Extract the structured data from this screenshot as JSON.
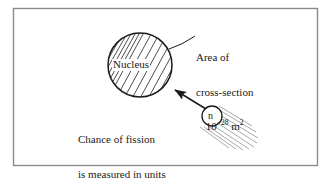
{
  "figure": {
    "border_color": "#8a8a8a",
    "ink_color": "#1a1a1a",
    "hatch_color": "#3a3a3a",
    "trail_color": "#9a9a9a",
    "background": "#ffffff"
  },
  "nucleus": {
    "label": "Nucleus",
    "shape": "hatched-circle",
    "center_x": 140,
    "center_y": 65,
    "radius": 32
  },
  "neutron": {
    "label": "n",
    "shape": "small-circle",
    "center_x": 212,
    "center_y": 116,
    "radius": 10,
    "trail_lines": 9
  },
  "annotation": {
    "line1": "Area of",
    "line2": "cross-section",
    "value_base": "10",
    "value_exponent": "−28",
    "value_unit": "m",
    "unit_exponent": "2"
  },
  "note": {
    "line1": "Chance of fission",
    "line2": "is measured in units",
    "line3": "of area of cross-section"
  },
  "arrow": {
    "name": "neutron-to-nucleus-arrow",
    "from_x": 207,
    "from_y": 110,
    "to_x": 172,
    "to_y": 88
  },
  "leader": {
    "name": "cross-section-leader-line",
    "from_x": 169,
    "from_y": 48,
    "to_x": 195,
    "to_y": 36
  }
}
